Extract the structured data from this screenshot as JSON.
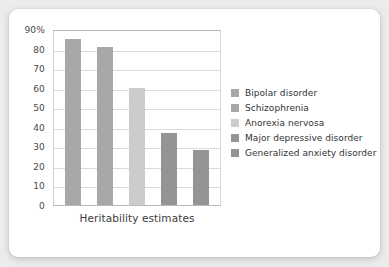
{
  "chart_data": {
    "type": "bar",
    "title": "",
    "subtitle": "",
    "xlabel": "Heritability estimates",
    "ylabel": "",
    "ylim": [
      0,
      90
    ],
    "ytick_step": 10,
    "grid": true,
    "legend_position": "right",
    "categories": [
      "Bipolar disorder",
      "Schizophrenia",
      "Anorexia nervosa",
      "Major depressive disorder",
      "Generalized anxiety disorder"
    ],
    "values": [
      85,
      81,
      60,
      37,
      28
    ],
    "ytick_labels": [
      "90%",
      "80",
      "70",
      "60",
      "50",
      "40",
      "30",
      "20",
      "10",
      "0"
    ],
    "ytick_values": [
      90,
      80,
      70,
      60,
      50,
      40,
      30,
      20,
      10,
      0
    ],
    "bar_colors": [
      "#a8a8a8",
      "#a8a8a8",
      "#cccccc",
      "#949494",
      "#949494"
    ],
    "legend": [
      {
        "label": "Bipolar disorder",
        "color": "#a8a8a8"
      },
      {
        "label": "Schizophrenia",
        "color": "#a8a8a8"
      },
      {
        "label": "Anorexia nervosa",
        "color": "#cccccc"
      },
      {
        "label": "Major depressive disorder",
        "color": "#949494"
      },
      {
        "label": "Generalized anxiety disorder",
        "color": "#949494"
      }
    ]
  },
  "theme": {
    "page_background": "#ececec",
    "card_background": "#ffffff",
    "gridline_color": "#dcdcdc",
    "axis_color": "#b4b4b4",
    "text_color": "#3c3c3c"
  }
}
